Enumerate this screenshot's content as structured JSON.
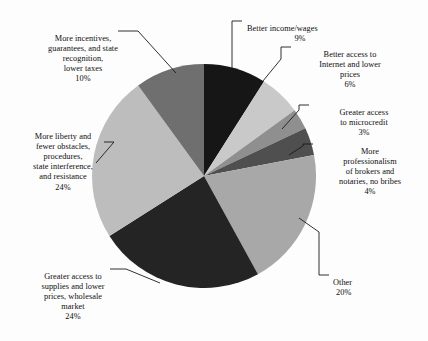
{
  "chart_data": {
    "type": "pie",
    "title": "",
    "categories": [
      "Better income/wages",
      "Better access to Internet and lower prices",
      "Greater access to microcredit",
      "More professionalism of brokers and notaries, no bribes",
      "Other",
      "Greater access to supplies and lower prices, wholesale market",
      "More liberty and fewer obstacles, procedures, state interference, and resistance",
      "More incentives, guarantees, and state recognition, lower taxes"
    ],
    "values": [
      9,
      6,
      3,
      4,
      20,
      24,
      24,
      10
    ],
    "unit": "%",
    "start_angle_deg": 0,
    "direction": "clockwise",
    "legend": "none",
    "labels_position": "outside-with-leader-lines",
    "colors": [
      "#161616",
      "#c9c9c9",
      "#8f8f8f",
      "#4f4f4f",
      "#a8a8a8",
      "#242424",
      "#bdbdbd",
      "#6f6f6f"
    ],
    "slices": [
      {
        "id": "income",
        "label": "Better income/wages",
        "label_lines": [
          "Better income/wages"
        ],
        "value": 9,
        "pct_text": "9%",
        "color": "#161616"
      },
      {
        "id": "internet",
        "label": "Better access to Internet and lower prices",
        "label_lines": [
          "Better access to",
          "Internet and lower",
          "prices"
        ],
        "value": 6,
        "pct_text": "6%",
        "color": "#c9c9c9"
      },
      {
        "id": "microcredit",
        "label": "Greater access to microcredit",
        "label_lines": [
          "Greater access",
          "to microcredit"
        ],
        "value": 3,
        "pct_text": "3%",
        "color": "#8f8f8f"
      },
      {
        "id": "brokers",
        "label": "More professionalism of brokers and notaries, no bribes",
        "label_lines": [
          "More",
          "professionalism",
          "of brokers and",
          "notaries, no bribes"
        ],
        "value": 4,
        "pct_text": "4%",
        "color": "#4f4f4f"
      },
      {
        "id": "other",
        "label": "Other",
        "label_lines": [
          "Other"
        ],
        "value": 20,
        "pct_text": "20%",
        "color": "#a8a8a8"
      },
      {
        "id": "supplies",
        "label": "Greater access to supplies and lower prices, wholesale market",
        "label_lines": [
          "Greater access to",
          "supplies and lower",
          "prices, wholesale",
          "market"
        ],
        "value": 24,
        "pct_text": "24%",
        "color": "#242424"
      },
      {
        "id": "liberty",
        "label": "More liberty and fewer obstacles, procedures, state interference, and resistance",
        "label_lines": [
          "More liberty and",
          "fewer obstacles,",
          "procedures,",
          "state interference,",
          "and resistance"
        ],
        "value": 24,
        "pct_text": "24%",
        "color": "#bdbdbd"
      },
      {
        "id": "incentives",
        "label": "More incentives, guarantees, and state recognition, lower taxes",
        "label_lines": [
          "More incentives,",
          "guarantees, and state",
          "recognition,",
          "lower taxes"
        ],
        "value": 10,
        "pct_text": "10%",
        "color": "#6f6f6f"
      }
    ]
  },
  "labels": {
    "income": {
      "text": "Better income/wages",
      "pct": "9%"
    },
    "internet": {
      "text": "Better access to\nInternet and lower\nprices",
      "pct": "6%"
    },
    "microcredit": {
      "text": "Greater access\nto microcredit",
      "pct": "3%"
    },
    "brokers": {
      "text": "More\nprofessionalism\nof brokers and\nnotaries, no bribes",
      "pct": "4%"
    },
    "other": {
      "text": "Other",
      "pct": "20%"
    },
    "supplies": {
      "text": "Greater access to\nsupplies and lower\nprices, wholesale\nmarket",
      "pct": "24%"
    },
    "liberty": {
      "text": "More liberty and\nfewer obstacles,\nprocedures,\nstate interference,\nand resistance",
      "pct": "24%"
    },
    "incentives": {
      "text": "More incentives,\nguarantees, and state\nrecognition,\nlower taxes",
      "pct": "10%"
    }
  },
  "caption": {
    "text": ""
  }
}
